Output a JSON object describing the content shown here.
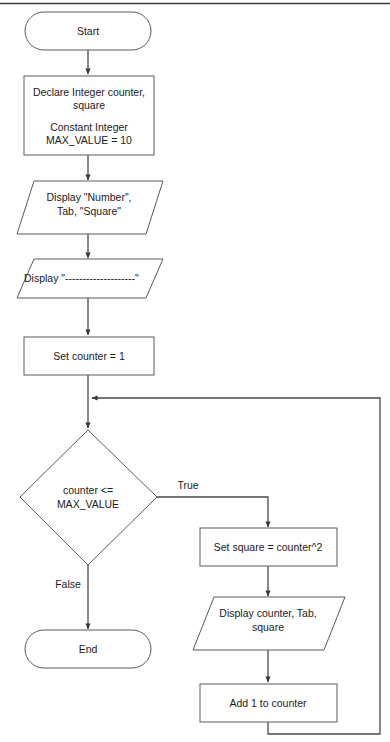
{
  "diagram": {
    "top_rule_color": "#3c3c3c",
    "outline_color": "#5a5a5a",
    "connector_color": "#4a4a4a",
    "text_color": "#1a1a1a",
    "background_color": "#ffffff"
  },
  "nodes": {
    "start": {
      "label": "Start",
      "shape": "terminator"
    },
    "declare": {
      "line1": "Declare Integer counter,",
      "line2": "square",
      "line3": "Constant Integer",
      "line4": "MAX_VALUE = 10",
      "shape": "process"
    },
    "display_header": {
      "line1": "Display \"Number\",",
      "line2": "Tab, \"Square\"",
      "shape": "io"
    },
    "display_divider": {
      "line1": "Display \"--------------------\"",
      "shape": "io"
    },
    "set_counter": {
      "label": "Set counter = 1",
      "shape": "process"
    },
    "decision": {
      "line1": "counter <=",
      "line2": "MAX_VALUE",
      "shape": "decision"
    },
    "set_square": {
      "label": "Set square = counter^2",
      "shape": "process"
    },
    "display_row": {
      "line1": "Display counter, Tab,",
      "line2": "square",
      "shape": "io"
    },
    "add_one": {
      "label": "Add 1 to counter",
      "shape": "process"
    },
    "end": {
      "label": "End",
      "shape": "terminator"
    }
  },
  "edge_labels": {
    "true_branch": "True",
    "false_branch": "False"
  }
}
